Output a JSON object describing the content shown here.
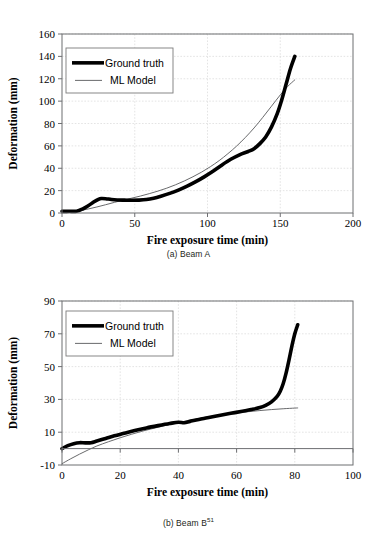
{
  "figures": [
    {
      "id": "a",
      "caption_prefix": "(a) Beam A",
      "caption_sup": "",
      "chart_data": {
        "type": "line",
        "title": "",
        "xlabel": "Fire exposure time (min)",
        "ylabel": "Deformation (mm)",
        "xlim": [
          0,
          200
        ],
        "ylim": [
          0,
          160
        ],
        "xticks": [
          0,
          50,
          100,
          150,
          200
        ],
        "yticks": [
          0,
          20,
          40,
          60,
          80,
          100,
          120,
          140,
          160
        ],
        "grid": true,
        "legend_position": "top-left",
        "series": [
          {
            "name": "Ground truth",
            "style": "thick-black",
            "x": [
              0,
              5,
              10,
              14,
              18,
              22,
              25,
              27,
              30,
              34,
              38,
              43,
              48,
              53,
              58,
              63,
              68,
              74,
              80,
              86,
              92,
              98,
              104,
              110,
              116,
              122,
              128,
              132,
              136,
              140,
              144,
              148,
              151,
              154,
              157,
              160
            ],
            "y": [
              1.5,
              1.5,
              1.6,
              3.5,
              6.5,
              10.0,
              12.2,
              13.0,
              12.8,
              12.0,
              11.6,
              11.5,
              11.4,
              11.5,
              12.0,
              13.2,
              15.0,
              17.5,
              20.5,
              24.0,
              28.0,
              32.5,
              37.5,
              43.0,
              48.0,
              52.0,
              55.0,
              57.5,
              62.0,
              68.0,
              77.0,
              89.0,
              101.0,
              115.0,
              129.0,
              140.0
            ]
          },
          {
            "name": "ML Model",
            "style": "thin-gray",
            "x": [
              0,
              6,
              12,
              18,
              24,
              30,
              36,
              42,
              48,
              54,
              60,
              66,
              72,
              78,
              84,
              90,
              96,
              102,
              108,
              114,
              120,
              126,
              132,
              138,
              144,
              150,
              155,
              160
            ],
            "y": [
              0.0,
              0.8,
              2.0,
              3.6,
              5.4,
              7.4,
              9.5,
              11.5,
              13.3,
              15.2,
              17.3,
              19.6,
              22.2,
              25.2,
              28.6,
              32.4,
              36.6,
              41.4,
              46.8,
              53.0,
              59.8,
              67.5,
              76.0,
              85.5,
              95.5,
              105.5,
              113.0,
              119.0
            ]
          }
        ]
      }
    },
    {
      "id": "b",
      "caption_prefix": "(b) Beam B",
      "caption_sup": "51",
      "chart_data": {
        "type": "line",
        "title": "",
        "xlabel": "Fire exposure time (min)",
        "ylabel": "Deformation (mm)",
        "xlim": [
          0,
          100
        ],
        "ylim": [
          -10,
          90
        ],
        "xticks": [
          0,
          20,
          40,
          60,
          80,
          100
        ],
        "yticks": [
          -10,
          10,
          30,
          50,
          70,
          90
        ],
        "grid": true,
        "legend_position": "top-left",
        "series": [
          {
            "name": "Ground truth",
            "style": "thick-black",
            "x": [
              0,
              2,
              4,
              6,
              8,
              10,
              12,
              15,
              18,
              21,
              25,
              29,
              33,
              37,
              40,
              42,
              44,
              47,
              50,
              54,
              58,
              62,
              65,
              68,
              70,
              72,
              74,
              75,
              76,
              77,
              78,
              79,
              80,
              81
            ],
            "y": [
              0.0,
              1.8,
              3.0,
              3.6,
              3.5,
              3.6,
              4.6,
              6.2,
              7.8,
              9.2,
              11.0,
              12.6,
              14.0,
              15.3,
              16.1,
              15.8,
              16.6,
              17.8,
              18.8,
              20.2,
              21.5,
              22.8,
              23.8,
              25.0,
              26.4,
              28.5,
              32.0,
              35.0,
              39.5,
              46.0,
              54.0,
              62.5,
              70.0,
              75.5
            ]
          },
          {
            "name": "ML Model",
            "style": "thin-gray",
            "x": [
              0,
              3,
              6,
              9,
              12,
              16,
              20,
              24,
              28,
              32,
              36,
              40,
              44,
              48,
              52,
              56,
              60,
              64,
              68,
              72,
              76,
              80,
              81
            ],
            "y": [
              -9.2,
              -6.2,
              -3.4,
              -0.8,
              1.6,
              4.2,
              6.6,
              8.8,
              10.8,
              12.6,
              14.3,
              15.9,
              17.3,
              18.6,
              19.8,
              20.8,
              21.7,
              22.5,
              23.2,
              23.8,
              24.3,
              24.7,
              24.8
            ]
          }
        ]
      }
    }
  ]
}
